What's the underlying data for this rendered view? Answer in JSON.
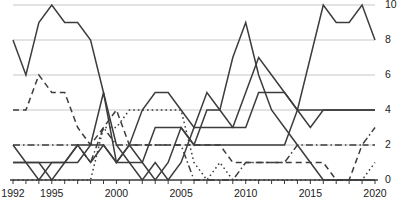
{
  "chart_data": {
    "type": "line",
    "title": "",
    "subtitle": "",
    "xlabel": "",
    "ylabel": "",
    "xlim": [
      1992,
      2020
    ],
    "ylim": [
      0,
      10
    ],
    "yticks": [
      0,
      2,
      4,
      6,
      8,
      10
    ],
    "ytick_labels": [
      "0",
      "2",
      "4",
      "6",
      "8",
      "10"
    ],
    "xticks": [
      1992,
      1993,
      1994,
      1995,
      1996,
      1997,
      1998,
      1999,
      2000,
      2001,
      2002,
      2003,
      2004,
      2005,
      2006,
      2007,
      2008,
      2009,
      2010,
      2011,
      2012,
      2013,
      2014,
      2015,
      2016,
      2017,
      2018,
      2019,
      2020
    ],
    "xtick_labels": [
      "1992",
      "1995",
      "2000",
      "2005",
      "2010",
      "2015",
      "2020"
    ],
    "labeled_xticks": [
      1992,
      1995,
      2000,
      2005,
      2010,
      2015,
      2020
    ],
    "grid": true,
    "grid_axis": "y",
    "legend": "none",
    "y_axis_position": "right",
    "x": [
      1992,
      1993,
      1994,
      1995,
      1996,
      1997,
      1998,
      1999,
      2000,
      2001,
      2002,
      2003,
      2004,
      2005,
      2006,
      2007,
      2008,
      2009,
      2010,
      2011,
      2012,
      2013,
      2014,
      2015,
      2016,
      2017,
      2018,
      2019,
      2020
    ],
    "series": [
      {
        "name": "series-1",
        "style": "solid",
        "color": "#3c3c3c",
        "values": [
          8,
          6,
          9,
          10,
          9,
          9,
          8,
          5,
          2,
          1,
          1,
          3,
          3,
          3,
          2,
          2,
          2,
          2,
          2,
          2,
          2,
          2,
          4,
          4,
          4,
          4,
          4,
          4,
          4
        ]
      },
      {
        "name": "series-2",
        "style": "solid",
        "color": "#3c3c3c",
        "values": [
          2,
          1,
          0,
          1,
          1,
          2,
          2,
          5,
          1,
          2,
          4,
          5,
          5,
          4,
          3,
          5,
          4,
          3,
          3,
          5,
          5,
          5,
          4,
          3,
          4,
          4,
          4,
          4,
          4
        ]
      },
      {
        "name": "series-3",
        "style": "solid",
        "color": "#3c3c3c",
        "values": [
          1,
          1,
          1,
          0,
          1,
          2,
          1,
          2,
          1,
          2,
          1,
          0,
          1,
          3,
          2,
          4,
          4,
          7,
          9,
          6,
          4,
          3,
          2,
          1,
          0,
          0,
          0,
          0,
          0
        ]
      },
      {
        "name": "series-4",
        "style": "solid",
        "color": "#3c3c3c",
        "values": [
          1,
          1,
          1,
          1,
          1,
          1,
          2,
          2,
          1,
          1,
          0,
          1,
          0,
          1,
          3,
          3,
          3,
          3,
          5,
          7,
          6,
          5,
          4,
          7,
          10,
          9,
          9,
          10,
          8
        ]
      },
      {
        "name": "series-5",
        "style": "dashed",
        "color": "#3c3c3c",
        "values": [
          4,
          4,
          6,
          5,
          5,
          3,
          2,
          3,
          4,
          2,
          2,
          2,
          2,
          2,
          2,
          2,
          2,
          1,
          1,
          1,
          1,
          1,
          1,
          1,
          1,
          0,
          0,
          2,
          2
        ]
      },
      {
        "name": "series-6",
        "style": "dashdot",
        "color": "#3c3c3c",
        "values": [
          2,
          2,
          2,
          2,
          2,
          2,
          1,
          3,
          2,
          2,
          2,
          2,
          2,
          2,
          0,
          0,
          0,
          0,
          1,
          1,
          1,
          1,
          2,
          2,
          2,
          2,
          2,
          2,
          3
        ]
      },
      {
        "name": "series-7",
        "style": "dotted",
        "color": "#3c3c3c",
        "values": [
          0,
          0,
          0,
          0,
          0,
          0,
          0,
          3,
          3,
          4,
          4,
          4,
          4,
          4,
          1,
          0,
          1,
          0,
          0,
          0,
          0,
          0,
          0,
          0,
          0,
          0,
          0,
          0,
          1
        ]
      }
    ]
  }
}
